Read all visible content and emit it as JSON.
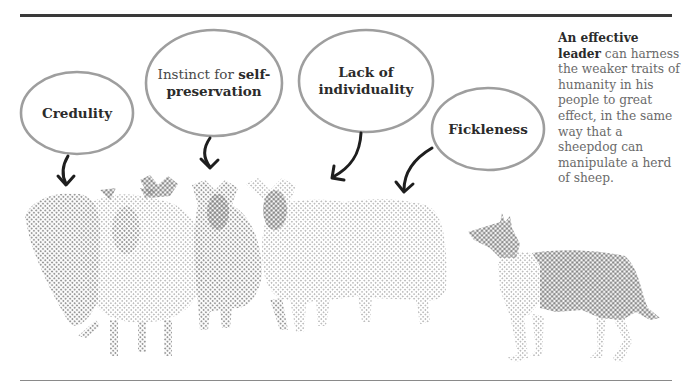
{
  "page": {
    "top_rule": "thick-dark",
    "bottom_rule": "thin-grey"
  },
  "bubbles": [
    {
      "id": "credulity",
      "lines": [
        {
          "bold": "Credulity"
        }
      ],
      "arrow_to": "sheep-1"
    },
    {
      "id": "self-preservation",
      "prefix": "Instinct for ",
      "bold_1": "self-",
      "bold_2": "preservation",
      "arrow_to": "sheep-3"
    },
    {
      "id": "lack-of-individuality",
      "line_1": "Lack of",
      "line_2": "individuality",
      "arrow_to": "sheep-4"
    },
    {
      "id": "fickleness",
      "line_1": "Fickleness",
      "arrow_to": "sheep-5"
    }
  ],
  "caption": {
    "bold": "An effective leader",
    "text": " can harness the weaker traits of humanity in his people to great effect, in the same way that a sheepdog can manipulate a herd of sheep."
  },
  "illustration": {
    "flock": "halftone-sheep-group",
    "dog": "halftone-sheepdog",
    "colors": {
      "ink": "#2a2a2a",
      "halftone": "#9a9a9a",
      "halftone_dark": "#7d7d7d",
      "bubble_stroke": "#9e9e9e"
    }
  }
}
